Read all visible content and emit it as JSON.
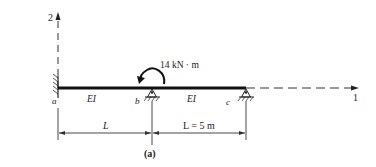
{
  "figure": {
    "caption": "(a)",
    "axes": {
      "vertical": "2",
      "horizontal": "1"
    },
    "load": {
      "moment": "14 kN · m"
    },
    "supports": {
      "a": "a",
      "b": "b",
      "c": "c"
    },
    "segments": {
      "left_stiffness": "EI",
      "right_stiffness": "EI"
    },
    "dimensions": {
      "left": "L",
      "right": "L = 5 m"
    }
  }
}
